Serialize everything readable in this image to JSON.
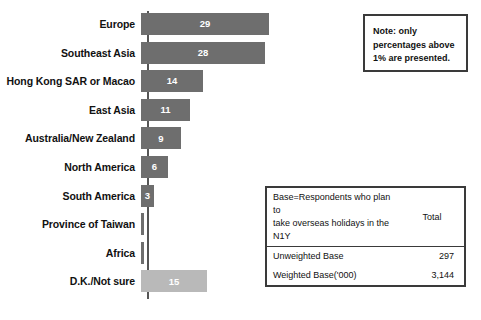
{
  "chart_data": {
    "type": "bar",
    "orientation": "horizontal",
    "title": "",
    "xlabel": "",
    "ylabel": "",
    "grid": false,
    "legend": "none",
    "xlim": [
      0,
      29
    ],
    "categories": [
      "Europe",
      "Southeast Asia",
      "Hong Kong SAR or Macao",
      "East Asia",
      "Australia/New Zealand",
      "North America",
      "South America",
      "Province of Taiwan",
      "Africa",
      "D.K./Not sure"
    ],
    "values": [
      29,
      28,
      14,
      11,
      9,
      6,
      3,
      0.5,
      0.5,
      15
    ],
    "value_labels": [
      "29",
      "28",
      "14",
      "11",
      "9",
      "6",
      "3",
      "",
      "",
      "15"
    ],
    "bar_colors": [
      "#6e6e6e",
      "#6e6e6e",
      "#6e6e6e",
      "#6e6e6e",
      "#6e6e6e",
      "#6e6e6e",
      "#6e6e6e",
      "#6e6e6e",
      "#6e6e6e",
      "#b9b9b9"
    ],
    "note": "Note: only percentages above 1% are presented."
  },
  "note_box": {
    "lines": [
      "Note: only",
      "percentages above",
      "1% are presented."
    ]
  },
  "base_table": {
    "header": {
      "description_line1": "Base=Respondents who plan to",
      "description_line2": "take overseas holidays in the N1Y",
      "total_label": "Total"
    },
    "rows": [
      {
        "label": "Unweighted Base",
        "total": "297"
      },
      {
        "label": "Weighted Base('000)",
        "total": "3,144"
      }
    ]
  },
  "colors": {
    "bar_dark": "#6e6e6e",
    "bar_light": "#b9b9b9",
    "axis": "#555555",
    "border": "#3a3a3a",
    "text": "#111111",
    "value_text": "#ffffff"
  }
}
